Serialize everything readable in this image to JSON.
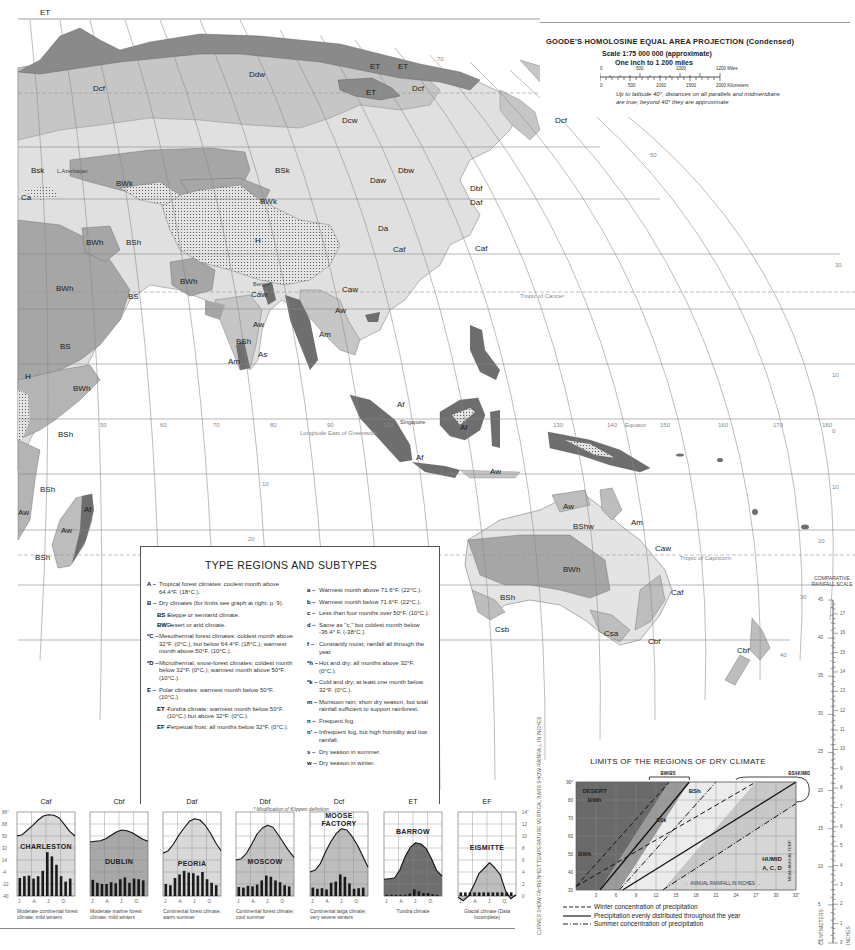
{
  "projection": {
    "title": "GOODE'S HOMOLOSINE EQUAL AREA PROJECTION (Condensed)",
    "scale": "Scale 1:75 000 000 (approximate)",
    "inch": "One inch to 1 200 miles",
    "miles_ticks": [
      "0",
      "500",
      "1000",
      "1200 Miles"
    ],
    "km_ticks": [
      "0",
      "500",
      "1000",
      "1500",
      "2000 Kilometers"
    ],
    "note": "Up to latitude 40°, distances on all parallels and midmeridians are true; beyond 40° they are approximate"
  },
  "map": {
    "region_labels": [
      {
        "text": "ET",
        "x": 40,
        "y": 8
      },
      {
        "text": "ET",
        "x": 370,
        "y": 62
      },
      {
        "text": "ET",
        "x": 366,
        "y": 88
      },
      {
        "text": "ET",
        "x": 398,
        "y": 62
      },
      {
        "text": "Ddw",
        "x": 249,
        "y": 70
      },
      {
        "text": "Dcf",
        "x": 93,
        "y": 84
      },
      {
        "text": "Dcf",
        "x": 412,
        "y": 84
      },
      {
        "text": "Dcf",
        "x": 555,
        "y": 116
      },
      {
        "text": "Dcw",
        "x": 342,
        "y": 116
      },
      {
        "text": "BSk",
        "x": 275,
        "y": 166
      },
      {
        "text": "Bsk",
        "x": 31,
        "y": 166
      },
      {
        "text": "BWk",
        "x": 116,
        "y": 179
      },
      {
        "text": "BWk",
        "x": 260,
        "y": 197
      },
      {
        "text": "Daw",
        "x": 370,
        "y": 176
      },
      {
        "text": "Dbw",
        "x": 398,
        "y": 166
      },
      {
        "text": "Dbf",
        "x": 470,
        "y": 184
      },
      {
        "text": "Daf",
        "x": 470,
        "y": 198
      },
      {
        "text": "Da",
        "x": 378,
        "y": 224
      },
      {
        "text": "Ca",
        "x": 21,
        "y": 193
      },
      {
        "text": "BWh",
        "x": 86,
        "y": 238
      },
      {
        "text": "BSh",
        "x": 126,
        "y": 238
      },
      {
        "text": "H",
        "x": 255,
        "y": 236
      },
      {
        "text": "Caf",
        "x": 393,
        "y": 245
      },
      {
        "text": "Caf",
        "x": 475,
        "y": 244
      },
      {
        "text": "BWh",
        "x": 180,
        "y": 277
      },
      {
        "text": "BWh",
        "x": 56,
        "y": 284
      },
      {
        "text": "BS",
        "x": 128,
        "y": 292
      },
      {
        "text": "Caw",
        "x": 251,
        "y": 290
      },
      {
        "text": "Caw",
        "x": 342,
        "y": 285
      },
      {
        "text": "Aw",
        "x": 253,
        "y": 320
      },
      {
        "text": "Aw",
        "x": 335,
        "y": 306
      },
      {
        "text": "BSh",
        "x": 236,
        "y": 337
      },
      {
        "text": "BS",
        "x": 60,
        "y": 342
      },
      {
        "text": "As",
        "x": 258,
        "y": 350
      },
      {
        "text": "Am",
        "x": 228,
        "y": 357
      },
      {
        "text": "Am",
        "x": 319,
        "y": 330
      },
      {
        "text": "BWh",
        "x": 73,
        "y": 384
      },
      {
        "text": "H",
        "x": 25,
        "y": 372
      },
      {
        "text": "Af",
        "x": 397,
        "y": 400
      },
      {
        "text": "Af",
        "x": 460,
        "y": 423
      },
      {
        "text": "Af",
        "x": 416,
        "y": 453
      },
      {
        "text": "BSh",
        "x": 58,
        "y": 430
      },
      {
        "text": "Aw",
        "x": 490,
        "y": 467
      },
      {
        "text": "BSh",
        "x": 40,
        "y": 485
      },
      {
        "text": "Aw",
        "x": 18,
        "y": 508
      },
      {
        "text": "Af",
        "x": 84,
        "y": 505
      },
      {
        "text": "Aw",
        "x": 61,
        "y": 526
      },
      {
        "text": "BSh",
        "x": 35,
        "y": 553
      },
      {
        "text": "Aw",
        "x": 563,
        "y": 502
      },
      {
        "text": "BShw",
        "x": 573,
        "y": 522
      },
      {
        "text": "Am",
        "x": 631,
        "y": 518
      },
      {
        "text": "Caw",
        "x": 655,
        "y": 544
      },
      {
        "text": "BWh",
        "x": 563,
        "y": 565
      },
      {
        "text": "Caf",
        "x": 671,
        "y": 588
      },
      {
        "text": "BSh",
        "x": 500,
        "y": 593
      },
      {
        "text": "Csb",
        "x": 495,
        "y": 625
      },
      {
        "text": "Csa",
        "x": 604,
        "y": 629
      },
      {
        "text": "Cbf",
        "x": 648,
        "y": 637
      },
      {
        "text": "Cbf",
        "x": 737,
        "y": 646
      }
    ],
    "place_labels": [
      {
        "text": "Singapore",
        "x": 400,
        "y": 419
      },
      {
        "text": "L.Azerbaijan",
        "x": 57,
        "y": 168
      },
      {
        "text": "Bengal",
        "x": 253,
        "y": 281
      }
    ],
    "graticule_labels": [
      {
        "text": "Tropic of Cancer",
        "x": 520,
        "y": 293
      },
      {
        "text": "Tropic of Capricorn",
        "x": 680,
        "y": 555
      },
      {
        "text": "Equator",
        "x": 625,
        "y": 422
      },
      {
        "text": "Longitude East of Greenwich",
        "x": 300,
        "y": 430
      },
      {
        "text": "50",
        "x": 100,
        "y": 422
      },
      {
        "text": "60",
        "x": 160,
        "y": 422
      },
      {
        "text": "70",
        "x": 213,
        "y": 422
      },
      {
        "text": "80",
        "x": 270,
        "y": 422
      },
      {
        "text": "90",
        "x": 327,
        "y": 422
      },
      {
        "text": "100",
        "x": 383,
        "y": 422
      },
      {
        "text": "130",
        "x": 553,
        "y": 422
      },
      {
        "text": "140",
        "x": 607,
        "y": 422
      },
      {
        "text": "150",
        "x": 660,
        "y": 422
      },
      {
        "text": "160",
        "x": 718,
        "y": 422
      },
      {
        "text": "170",
        "x": 773,
        "y": 422
      },
      {
        "text": "180",
        "x": 822,
        "y": 422
      },
      {
        "text": "0",
        "x": 832,
        "y": 428
      },
      {
        "text": "10",
        "x": 832,
        "y": 484
      },
      {
        "text": "10",
        "x": 262,
        "y": 481
      },
      {
        "text": "20",
        "x": 818,
        "y": 538
      },
      {
        "text": "20",
        "x": 248,
        "y": 536
      },
      {
        "text": "30",
        "x": 800,
        "y": 594
      },
      {
        "text": "40",
        "x": 780,
        "y": 652
      },
      {
        "text": "10",
        "x": 832,
        "y": 372
      },
      {
        "text": "30",
        "x": 835,
        "y": 262
      },
      {
        "text": "50",
        "x": 650,
        "y": 152
      },
      {
        "text": "60",
        "x": 557,
        "y": 100
      },
      {
        "text": "70",
        "x": 437,
        "y": 56
      },
      {
        "text": "60",
        "x": 163,
        "y": 720
      }
    ]
  },
  "legend": {
    "title": "TYPE REGIONS AND SUBTYPES",
    "left": [
      {
        "key": "A –",
        "text": "Tropical forest climates: coolest month above 64.4°F. (18°C.)."
      },
      {
        "key": "B –",
        "text": "Dry climates (for limits see graph at right, p. 9)."
      },
      {
        "key": "BS –",
        "text": "Steppe or semiarid climate.",
        "sub": true
      },
      {
        "key": "BW –",
        "text": "Desert or arid climate.",
        "sub": true
      },
      {
        "key": "*C –",
        "text": "Mesothermal forest climates: coldest month above 32°F. (0°C.), but below 64.4°F. (18°C.); warmest month above 50°F. (10°C.)."
      },
      {
        "key": "*D –",
        "text": "Microthermal, snow-forest climates: coldest month below 32°F. (0°C.); warmest month above 50°F. (10°C.)."
      },
      {
        "key": "E –",
        "text": "Polar climates: warmest month below 50°F. (10°C.)."
      },
      {
        "key": "ET –",
        "text": "Tundra climate: warmest month below 50°F. (10°C.) but above 32°F. (0°C.).",
        "sub": true
      },
      {
        "key": "EF –",
        "text": "Perpetual frost: all months below 32°F. (0°C.).",
        "sub": true
      }
    ],
    "right": [
      {
        "key": "a –",
        "text": "Warmest month above 71.6°F. (22°C.)."
      },
      {
        "key": "b –",
        "text": "Warmest month below 71.6°F. (22°C.)."
      },
      {
        "key": "c –",
        "text": "Less than four months over 50°F. (10°C.)."
      },
      {
        "key": "d –",
        "text": "Same as \"c,\" but coldest month below -36.4° F. (-38°C.)."
      },
      {
        "key": "f –",
        "text": "Constantly moist; rainfall all through the year."
      },
      {
        "key": "*h –",
        "text": "Hot and dry; all months above 32°F. (0°C.)."
      },
      {
        "key": "*k –",
        "text": "Cold and dry; at least one month below 32°F. (0°C.)."
      },
      {
        "key": "m –",
        "text": "Monsoon rain; short dry season, but total rainfall sufficient to support rainforest."
      },
      {
        "key": "n –",
        "text": "Frequent fog."
      },
      {
        "key": "n' –",
        "text": "Infrequent fog, but high humidity and low rainfall."
      },
      {
        "key": "s –",
        "text": "Dry season in summer."
      },
      {
        "key": "w –",
        "text": "Dry season in winter."
      }
    ],
    "footnote": "* Modification of Köppen definition"
  },
  "climographs": {
    "y_axis_temp": [
      "86°",
      "68",
      "50",
      "32",
      "14",
      "-4",
      "-22",
      "-40"
    ],
    "y_axis_rain": [
      "14\"",
      "12",
      "10",
      "8",
      "6",
      "4",
      "2",
      "0"
    ],
    "month_ticks": [
      "J.",
      "A.",
      "J.",
      "O."
    ],
    "axis_note": "CURVES SHOW FAHRENHEIT TEMPERATURE VERTICAL BARS SHOW RAINFALL IN INCHES",
    "items": [
      {
        "code": "Caf",
        "city": "CHARLESTON",
        "caption": "Moderate continental forest climate; mild winters",
        "shade": "#d9d9d9",
        "temp": [
          50,
          52,
          59,
          66,
          74,
          80,
          82,
          81,
          77,
          67,
          57,
          50
        ],
        "rain": [
          3,
          3.3,
          3.4,
          2.9,
          3.3,
          4.2,
          7.3,
          6.6,
          5.2,
          3.3,
          2.4,
          2.9
        ]
      },
      {
        "code": "Cbf",
        "city": "DUBLIN",
        "caption": "Moderate marine forest climate; mild winters",
        "shade": "#a8a8a8",
        "temp": [
          41,
          42,
          43,
          46,
          51,
          56,
          59,
          58,
          55,
          50,
          45,
          42
        ],
        "rain": [
          2.7,
          2.2,
          2.0,
          2.0,
          2.3,
          2.1,
          2.8,
          3.1,
          2.2,
          2.9,
          2.8,
          2.6
        ]
      },
      {
        "code": "Daf",
        "city": "PEORIA",
        "caption": "Continental forest climate; warm summer",
        "shade": "#d9d9d9",
        "temp": [
          24,
          28,
          38,
          51,
          62,
          72,
          76,
          74,
          66,
          54,
          40,
          28
        ],
        "rain": [
          2.0,
          1.8,
          3.0,
          3.6,
          4.2,
          3.9,
          3.8,
          3.4,
          4.0,
          2.8,
          2.2,
          1.8
        ]
      },
      {
        "code": "Dbf",
        "city": "MOSCOW",
        "caption": "Continental forest climate; cool summer",
        "shade": "#c4c4c4",
        "temp": [
          14,
          16,
          24,
          38,
          53,
          62,
          66,
          63,
          52,
          40,
          28,
          18
        ],
        "rain": [
          1.5,
          1.4,
          1.7,
          1.6,
          1.9,
          2.6,
          3.4,
          3.2,
          2.6,
          2.3,
          1.8,
          1.6
        ]
      },
      {
        "code": "Dcf",
        "city": "MOOSE FACTORY",
        "caption": "Continental taiga climate; very severe winters",
        "shade": "#bdbdbd",
        "temp": [
          -4,
          -1,
          9,
          27,
          42,
          54,
          61,
          59,
          49,
          36,
          20,
          3
        ],
        "rain": [
          1.4,
          1.2,
          1.3,
          1.1,
          2.2,
          2.4,
          3.6,
          3.2,
          2.1,
          1.2,
          1.3,
          1.4
        ]
      },
      {
        "code": "ET",
        "city": "BARROW",
        "caption": "Tundra climate",
        "shade": "#6e6e6e",
        "temp": [
          -15,
          -14,
          -13,
          -1,
          19,
          33,
          40,
          38,
          31,
          16,
          -2,
          -10
        ],
        "rain": [
          0.2,
          0.2,
          0.2,
          0.2,
          0.2,
          0.4,
          1.1,
          0.8,
          0.5,
          0.5,
          0.3,
          0.2
        ]
      },
      {
        "code": "EF",
        "city": "EISMITTE",
        "caption": "Glacial climate (Data incomplete)",
        "shade": "#bdbdbd",
        "temp": [
          -42,
          -47,
          -40,
          -24,
          -6,
          2,
          10,
          2,
          -8,
          -32,
          -44,
          -38
        ],
        "rain": [
          0.6,
          0.6,
          0.6,
          0.6,
          0.6,
          0.6,
          0.6,
          0.6,
          0.6,
          0.6,
          0.6,
          0.6
        ]
      }
    ]
  },
  "chart_data": {
    "type": "line",
    "title": "LIMITS OF THE REGIONS OF DRY CLIMATE",
    "xlabel": "ANNUAL RAINFALL IN INCHES",
    "ylabel": "MEAN ANNUAL TEMPERATURE (FAHRENHEIT)",
    "x_ticks": [
      3,
      6,
      9,
      12,
      15,
      18,
      21,
      24,
      27,
      30,
      33
    ],
    "y_ticks": [
      30,
      40,
      50,
      60,
      70,
      80,
      90
    ],
    "xlim": [
      0,
      33
    ],
    "ylim": [
      30,
      90
    ],
    "regions": [
      "DESERT BWh",
      "BWk",
      "BSh",
      "BSk",
      "HUMID A, C, D"
    ],
    "boundary_labels": [
      "BW/BS",
      "BS/HUMID"
    ],
    "series": [
      {
        "name": "BW/BS winter concentration",
        "style": "dashed",
        "x": [
          0,
          14
        ],
        "y": [
          32,
          90
        ]
      },
      {
        "name": "BW/BS evenly distributed",
        "style": "solid",
        "x": [
          3.6,
          17
        ],
        "y": [
          30,
          90
        ]
      },
      {
        "name": "BW/BS summer concentration",
        "style": "dash-dot",
        "x": [
          6.5,
          21
        ],
        "y": [
          30,
          90
        ]
      },
      {
        "name": "BS/HUMID winter concentration",
        "style": "dashed",
        "x": [
          0,
          27
        ],
        "y": [
          32,
          90
        ]
      },
      {
        "name": "BS/HUMID evenly distributed",
        "style": "solid",
        "x": [
          7,
          33
        ],
        "y": [
          30,
          90
        ]
      },
      {
        "name": "BS/HUMID summer concentration",
        "style": "dash-dot",
        "x": [
          13,
          33
        ],
        "y": [
          30,
          78
        ]
      }
    ],
    "legend": [
      "Winter concentration of precipitation",
      "Precipitation evenly distributed throughout the year",
      "Summer concentration of precipitation"
    ],
    "grid": true
  },
  "rainfall_scale": {
    "title": "COMPARATIVE RAINFALL SCALE",
    "cm_ticks": [
      "45",
      "40",
      "35",
      "30",
      "25",
      "20",
      "15",
      "10",
      "5",
      "0"
    ],
    "inch_ticks": [
      "17",
      "16",
      "15",
      "14",
      "13",
      "12",
      "11",
      "10",
      "9",
      "8",
      "7",
      "6",
      "5",
      "4",
      "3",
      "2",
      "1",
      "0"
    ],
    "cm_label": "CENTIMETERS",
    "inch_label": "INCHES"
  }
}
